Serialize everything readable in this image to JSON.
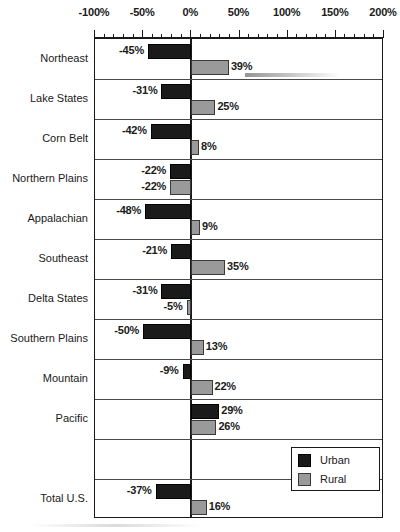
{
  "chart_data": {
    "type": "bar",
    "orientation": "horizontal",
    "title": "",
    "xlabel": "",
    "ylabel": "",
    "xlim": [
      -100,
      200
    ],
    "xticks": [
      -100,
      -50,
      0,
      50,
      100,
      150,
      200
    ],
    "xtick_labels": [
      "-100%",
      "-50%",
      "0%",
      "50%",
      "100%",
      "150%",
      "200%"
    ],
    "minor_tick_step": 10,
    "grid": false,
    "legend_position": "bottom-right",
    "categories": [
      "Northeast",
      "Lake States",
      "Corn Belt",
      "Northern Plains",
      "Appalachian",
      "Southeast",
      "Delta States",
      "Southern Plains",
      "Mountain",
      "Pacific",
      "",
      "Total U.S."
    ],
    "series": [
      {
        "name": "Urban",
        "color": "#1a1a1a",
        "values": [
          -45,
          -31,
          -42,
          -22,
          -48,
          -21,
          -31,
          -50,
          -9,
          29,
          null,
          -37
        ],
        "labels": [
          "-45%",
          "-31%",
          "-42%",
          "-22%",
          "-48%",
          "-21%",
          "-31%",
          "-50%",
          "-9%",
          "29%",
          "",
          "-37%"
        ]
      },
      {
        "name": "Rural",
        "color": "#9a9a9a",
        "values": [
          39,
          25,
          8,
          -22,
          9,
          35,
          -5,
          13,
          22,
          26,
          null,
          16
        ],
        "labels": [
          "39%",
          "25%",
          "8%",
          "-22%",
          "9%",
          "35%",
          "-5%",
          "13%",
          "22%",
          "26%",
          "",
          "16%"
        ]
      }
    ]
  },
  "legend": {
    "entries": [
      {
        "label": "Urban",
        "swatch": "urban"
      },
      {
        "label": "Rural",
        "swatch": "rural"
      }
    ]
  },
  "colors": {
    "urban": "#1a1a1a",
    "rural": "#9a9a9a",
    "axis": "#1a1a1a",
    "background": "#ffffff"
  }
}
